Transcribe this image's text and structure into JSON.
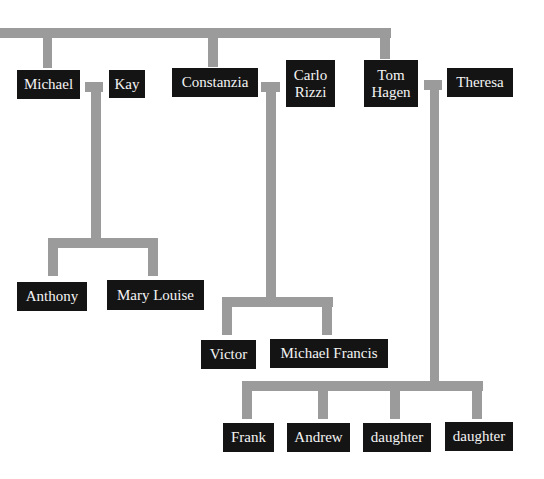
{
  "diagram": {
    "type": "family-tree",
    "line_color": "#9b9b9b",
    "box_color": "#141414",
    "text_color": "#f4f4f4",
    "generation_1": {
      "couples": [
        {
          "spouse_a": "Michael",
          "spouse_b": "Kay"
        },
        {
          "spouse_a": "Constanzia",
          "spouse_b": "Carlo\nRizzi"
        },
        {
          "spouse_a": "Tom\nHagen",
          "spouse_b": "Theresa"
        }
      ]
    },
    "generation_2": {
      "michael_kay_children": [
        "Anthony",
        "Mary Louise"
      ],
      "constanzia_carlo_children": [
        "Victor",
        "Michael Francis"
      ],
      "tom_theresa_children": [
        "Frank",
        "Andrew",
        "daughter",
        "daughter"
      ]
    }
  }
}
